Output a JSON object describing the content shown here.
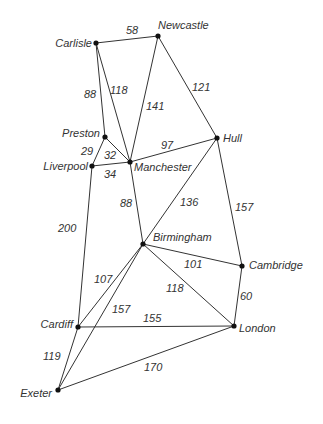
{
  "nodes": [
    {
      "id": "Carlisle",
      "x": 96,
      "y": 43,
      "lx": 92,
      "ly": 47,
      "anchor": "end"
    },
    {
      "id": "Newcastle",
      "x": 158,
      "y": 36,
      "lx": 158,
      "ly": 29,
      "anchor": "start"
    },
    {
      "id": "Preston",
      "x": 105,
      "y": 137,
      "lx": 100,
      "ly": 137,
      "anchor": "end"
    },
    {
      "id": "Liverpool",
      "x": 92,
      "y": 166,
      "lx": 88,
      "ly": 170,
      "anchor": "end"
    },
    {
      "id": "Manchester",
      "x": 130,
      "y": 162,
      "lx": 134,
      "ly": 171,
      "anchor": "start"
    },
    {
      "id": "Hull",
      "x": 217,
      "y": 138,
      "lx": 223,
      "ly": 142,
      "anchor": "start"
    },
    {
      "id": "Birmingham",
      "x": 143,
      "y": 244,
      "lx": 153,
      "ly": 241,
      "anchor": "start"
    },
    {
      "id": "Cambridge",
      "x": 242,
      "y": 266,
      "lx": 249,
      "ly": 269,
      "anchor": "start"
    },
    {
      "id": "London",
      "x": 234,
      "y": 326,
      "lx": 239,
      "ly": 332,
      "anchor": "start"
    },
    {
      "id": "Cardiff",
      "x": 78,
      "y": 327,
      "lx": 73,
      "ly": 328,
      "anchor": "end"
    },
    {
      "id": "Exeter",
      "x": 58,
      "y": 390,
      "lx": 52,
      "ly": 397,
      "anchor": "end"
    }
  ],
  "edges": [
    {
      "from": "Carlisle",
      "to": "Newcastle",
      "w": "58",
      "wx": 126,
      "wy": 34
    },
    {
      "from": "Carlisle",
      "to": "Preston",
      "w": "88",
      "wx": 84,
      "wy": 98
    },
    {
      "from": "Carlisle",
      "to": "Manchester",
      "w": "118",
      "wx": 110,
      "wy": 94
    },
    {
      "from": "Newcastle",
      "to": "Manchester",
      "w": "141",
      "wx": 146,
      "wy": 110
    },
    {
      "from": "Newcastle",
      "to": "Hull",
      "w": "121",
      "wx": 192,
      "wy": 91
    },
    {
      "from": "Preston",
      "to": "Liverpool",
      "w": "29",
      "wx": 81,
      "wy": 155
    },
    {
      "from": "Preston",
      "to": "Manchester",
      "w": "32",
      "wx": 104,
      "wy": 159
    },
    {
      "from": "Liverpool",
      "to": "Manchester",
      "w": "34",
      "wx": 104,
      "wy": 178
    },
    {
      "from": "Manchester",
      "to": "Hull",
      "w": "97",
      "wx": 161,
      "wy": 149
    },
    {
      "from": "Manchester",
      "to": "Birmingham",
      "w": "88",
      "wx": 120,
      "wy": 207
    },
    {
      "from": "Hull",
      "to": "Birmingham",
      "w": "136",
      "wx": 180,
      "wy": 206
    },
    {
      "from": "Hull",
      "to": "Cambridge",
      "w": "157",
      "wx": 235,
      "wy": 211
    },
    {
      "from": "Liverpool",
      "to": "Cardiff",
      "w": "200",
      "wx": 58,
      "wy": 232
    },
    {
      "from": "Birmingham",
      "to": "Cambridge",
      "w": "101",
      "wx": 184,
      "wy": 268
    },
    {
      "from": "Birmingham",
      "to": "London",
      "w": "118",
      "wx": 166,
      "wy": 292
    },
    {
      "from": "Birmingham",
      "to": "Cardiff",
      "w": "107",
      "wx": 94,
      "wy": 283
    },
    {
      "from": "Birmingham",
      "to": "Exeter",
      "w": "157",
      "wx": 112,
      "wy": 313
    },
    {
      "from": "Cambridge",
      "to": "London",
      "w": "60",
      "wx": 240,
      "wy": 300
    },
    {
      "from": "Cardiff",
      "to": "London",
      "w": "155",
      "wx": 143,
      "wy": 322
    },
    {
      "from": "Cardiff",
      "to": "Exeter",
      "w": "119",
      "wx": 43,
      "wy": 360
    },
    {
      "from": "Exeter",
      "to": "London",
      "w": "170",
      "wx": 144,
      "wy": 371
    }
  ]
}
